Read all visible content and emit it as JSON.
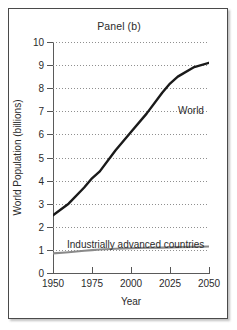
{
  "title": "Panel (b)",
  "axes": {
    "xlabel": "Year",
    "ylabel": "World Population (billions)",
    "yticks": [
      "0",
      "1",
      "2",
      "3",
      "4",
      "5",
      "6",
      "7",
      "8",
      "9",
      "10"
    ],
    "xticks": [
      "1950",
      "1975",
      "2000",
      "2025",
      "2050"
    ]
  },
  "labels": {
    "world": "World",
    "industrial": "Industrially advanced countries"
  },
  "colors": {
    "world_line": "#1a1a1a",
    "industrial_line": "#8a8a8a",
    "grid": "#8f8f8f",
    "axis": "#5a5a5a",
    "frame": "#4a4a4a",
    "background": "#ffffff"
  },
  "chart_data": {
    "type": "line",
    "title": "Panel (b)",
    "xlabel": "Year",
    "ylabel": "World Population (billions)",
    "xlim": [
      1950,
      2050
    ],
    "ylim": [
      0,
      10
    ],
    "xticks": [
      1950,
      1975,
      2000,
      2025,
      2050
    ],
    "yticks": [
      0,
      1,
      2,
      3,
      4,
      5,
      6,
      7,
      8,
      9,
      10
    ],
    "grid": "horizontal-dotted",
    "legend": "inline-annotations",
    "x": [
      1950,
      1960,
      1970,
      1975,
      1980,
      1990,
      2000,
      2010,
      2020,
      2025,
      2030,
      2040,
      2050
    ],
    "series": [
      {
        "name": "World",
        "color": "#1a1a1a",
        "values": [
          2.5,
          3.0,
          3.7,
          4.1,
          4.4,
          5.3,
          6.1,
          6.9,
          7.8,
          8.2,
          8.5,
          8.9,
          9.1
        ]
      },
      {
        "name": "Industrially advanced countries",
        "color": "#8a8a8a",
        "values": [
          0.85,
          0.9,
          0.96,
          0.99,
          1.02,
          1.05,
          1.07,
          1.09,
          1.1,
          1.11,
          1.12,
          1.13,
          1.15
        ]
      }
    ],
    "annotations": [
      {
        "text": "World",
        "x": 2025,
        "y": 7.3
      },
      {
        "text": "Industrially advanced countries",
        "x": 1990,
        "y": 1.55
      }
    ]
  }
}
